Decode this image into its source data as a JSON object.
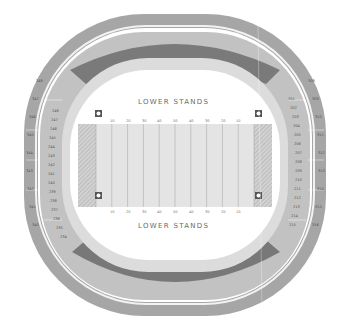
{
  "stadium": {
    "labels": {
      "north_stands": "LOWER STANDS",
      "south_stands": "LOWER STANDS"
    },
    "field": {
      "yard_lines_top": [
        "10",
        "20",
        "30",
        "40",
        "50",
        "40",
        "30",
        "20",
        "10"
      ],
      "yard_lines_bottom": [
        "10",
        "20",
        "30",
        "40",
        "50",
        "40",
        "30",
        "20",
        "10"
      ],
      "colors": {
        "field": "#e4e4e4",
        "endzone": "#c8c8c8",
        "line": "#9a9a9a"
      }
    },
    "corner_markers": {
      "icon": "camera-icon",
      "count": 4
    },
    "rings": {
      "upper": {
        "color": "#9e9e9e"
      },
      "mezzanine_ends": {
        "color": "#777777"
      },
      "middle": {
        "color": "#c4c4c4"
      },
      "lower": {
        "color": "#dcdcdc"
      }
    },
    "sections": {
      "left_inner": [
        "248",
        "247",
        "246",
        "245",
        "244",
        "243",
        "242",
        "241",
        "240",
        "239",
        "238",
        "237",
        "236",
        "235",
        "234"
      ],
      "left_outer": [
        "348",
        "347",
        "346",
        "345",
        "344",
        "343",
        "342",
        "341",
        "340"
      ],
      "right_inner": [
        "201",
        "202",
        "203",
        "204",
        "205",
        "206",
        "207",
        "208",
        "209",
        "210",
        "211",
        "212",
        "213",
        "214",
        "215"
      ],
      "right_outer": [
        "308",
        "309",
        "310",
        "311",
        "312",
        "313",
        "314",
        "315",
        "316"
      ]
    }
  }
}
